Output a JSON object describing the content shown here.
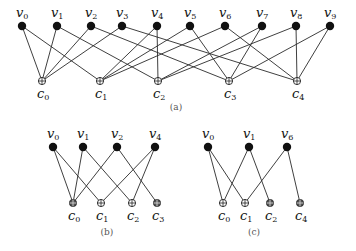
{
  "figures": [
    {
      "id": "a",
      "caption": "(a)",
      "caption_pos": [
        176,
        110
      ],
      "variable_nodes": [
        {
          "name": "v",
          "sub": "0",
          "x": 22,
          "y": 26
        },
        {
          "name": "v",
          "sub": "1",
          "x": 57,
          "y": 26
        },
        {
          "name": "v",
          "sub": "2",
          "x": 91,
          "y": 26
        },
        {
          "name": "v",
          "sub": "3",
          "x": 122,
          "y": 26
        },
        {
          "name": "v",
          "sub": "4",
          "x": 157,
          "y": 26
        },
        {
          "name": "v",
          "sub": "5",
          "x": 190,
          "y": 26
        },
        {
          "name": "v",
          "sub": "6",
          "x": 225,
          "y": 26
        },
        {
          "name": "v",
          "sub": "7",
          "x": 262,
          "y": 26
        },
        {
          "name": "v",
          "sub": "8",
          "x": 296,
          "y": 26
        },
        {
          "name": "v",
          "sub": "9",
          "x": 330,
          "y": 26
        }
      ],
      "check_nodes": [
        {
          "name": "c",
          "sub": "0",
          "x": 42,
          "y": 81,
          "dark": false
        },
        {
          "name": "c",
          "sub": "1",
          "x": 100,
          "y": 81,
          "dark": false
        },
        {
          "name": "c",
          "sub": "2",
          "x": 158,
          "y": 81,
          "dark": false
        },
        {
          "name": "c",
          "sub": "3",
          "x": 229,
          "y": 81,
          "dark": false
        },
        {
          "name": "c",
          "sub": "4",
          "x": 297,
          "y": 81,
          "dark": false
        }
      ],
      "edges": [
        [
          0,
          0
        ],
        [
          0,
          1
        ],
        [
          1,
          0
        ],
        [
          1,
          2
        ],
        [
          2,
          0
        ],
        [
          2,
          3
        ],
        [
          3,
          0
        ],
        [
          3,
          4
        ],
        [
          4,
          1
        ],
        [
          4,
          2
        ],
        [
          5,
          1
        ],
        [
          5,
          3
        ],
        [
          6,
          1
        ],
        [
          6,
          4
        ],
        [
          7,
          2
        ],
        [
          7,
          3
        ],
        [
          8,
          2
        ],
        [
          8,
          4
        ],
        [
          9,
          3
        ],
        [
          9,
          4
        ]
      ]
    },
    {
      "id": "b",
      "caption": "(b)",
      "caption_pos": [
        107,
        235
      ],
      "variable_nodes": [
        {
          "name": "v",
          "sub": "0",
          "x": 53,
          "y": 147
        },
        {
          "name": "v",
          "sub": "1",
          "x": 83,
          "y": 147
        },
        {
          "name": "v",
          "sub": "2",
          "x": 117,
          "y": 147
        },
        {
          "name": "v",
          "sub": "4",
          "x": 155,
          "y": 147
        }
      ],
      "check_nodes": [
        {
          "name": "c",
          "sub": "0",
          "x": 73,
          "y": 203,
          "dark": true
        },
        {
          "name": "c",
          "sub": "1",
          "x": 101,
          "y": 203,
          "dark": false
        },
        {
          "name": "c",
          "sub": "2",
          "x": 132,
          "y": 203,
          "dark": false
        },
        {
          "name": "c",
          "sub": "3",
          "x": 157,
          "y": 203,
          "dark": true
        }
      ],
      "edges": [
        [
          0,
          0
        ],
        [
          0,
          1
        ],
        [
          1,
          0
        ],
        [
          1,
          2
        ],
        [
          2,
          0
        ],
        [
          2,
          3
        ],
        [
          3,
          1
        ],
        [
          3,
          2
        ]
      ]
    },
    {
      "id": "c",
      "caption": "(c)",
      "caption_pos": [
        254,
        235
      ],
      "variable_nodes": [
        {
          "name": "v",
          "sub": "0",
          "x": 208,
          "y": 147
        },
        {
          "name": "v",
          "sub": "1",
          "x": 249,
          "y": 147
        },
        {
          "name": "v",
          "sub": "6",
          "x": 287,
          "y": 147
        }
      ],
      "check_nodes": [
        {
          "name": "c",
          "sub": "0",
          "x": 223,
          "y": 203,
          "dark": false
        },
        {
          "name": "c",
          "sub": "1",
          "x": 245,
          "y": 203,
          "dark": false
        },
        {
          "name": "c",
          "sub": "2",
          "x": 270,
          "y": 203,
          "dark": true
        },
        {
          "name": "c",
          "sub": "4",
          "x": 300,
          "y": 203,
          "dark": true
        }
      ],
      "edges": [
        [
          0,
          0
        ],
        [
          0,
          1
        ],
        [
          1,
          0
        ],
        [
          1,
          2
        ],
        [
          2,
          1
        ],
        [
          2,
          3
        ]
      ]
    }
  ]
}
